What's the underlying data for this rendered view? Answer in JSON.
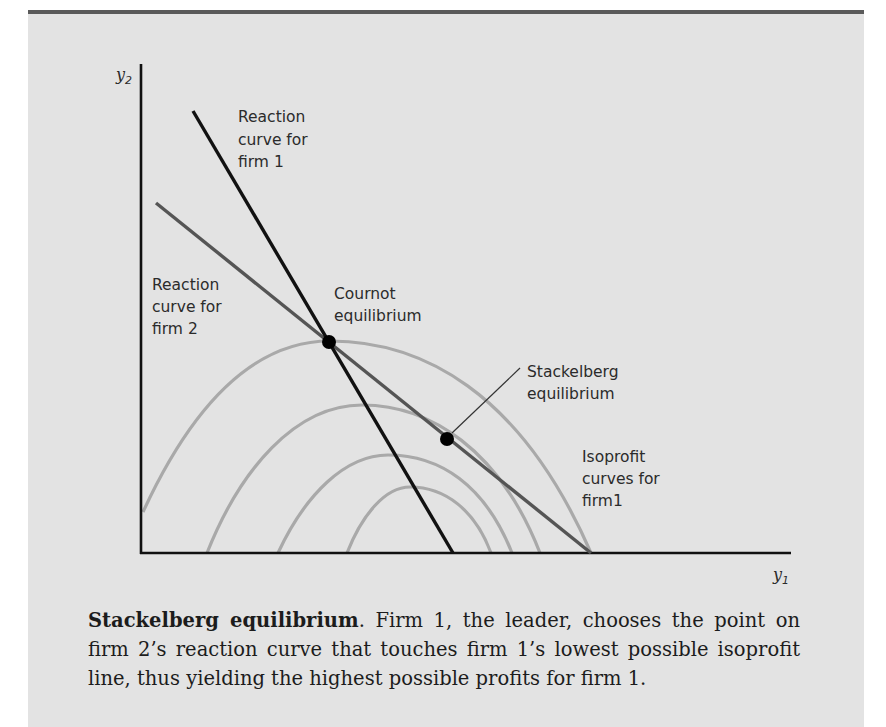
{
  "figure": {
    "axes": {
      "x_label": "y",
      "x_subscript": "1",
      "y_label": "y",
      "y_subscript": "2"
    },
    "labels": {
      "firm1_reaction": [
        "Reaction",
        "curve for",
        "firm 1"
      ],
      "firm2_reaction": [
        "Reaction",
        "curve for",
        "firm 2"
      ],
      "cournot": [
        "Cournot",
        "equilibrium"
      ],
      "stackelberg": [
        "Stackelberg",
        "equilibrium"
      ],
      "isoprofit": [
        "Isoprofit",
        "curves for",
        "firm1"
      ]
    },
    "colors": {
      "background": "#e3e3e3",
      "axis": "#111111",
      "firm1_reaction": "#111111",
      "firm2_reaction": "#555555",
      "isoprofit": "#a9a9a9",
      "points": "#000000"
    },
    "elements": {
      "firm1_reaction_curve": {
        "from": [
          193,
          111
        ],
        "to": [
          453,
          553
        ]
      },
      "firm2_reaction_curve": {
        "from": [
          156,
          203
        ],
        "to": [
          591,
          553
        ]
      },
      "cournot_point": [
        329,
        342
      ],
      "stackelberg_point": [
        447,
        439
      ],
      "isoprofit_curves": [
        {
          "start": [
            143,
            512
          ],
          "peak": [
            330,
            341
          ],
          "end": [
            591,
            553
          ]
        },
        {
          "start": [
            207,
            553
          ],
          "peak": [
            362,
            405
          ],
          "end": [
            540,
            553
          ]
        },
        {
          "start": [
            278,
            553
          ],
          "peak": [
            388,
            455
          ],
          "end": [
            512,
            553
          ]
        },
        {
          "start": [
            347,
            553
          ],
          "peak": [
            410,
            487
          ],
          "end": [
            491,
            553
          ]
        }
      ]
    }
  },
  "caption": {
    "title": "Stackelberg equilibrium",
    "body": ". Firm 1, the leader, chooses the point on firm 2’s reaction curve that touches firm 1’s lowest possible isoprofit line, thus yielding the highest possible profits for firm 1."
  }
}
